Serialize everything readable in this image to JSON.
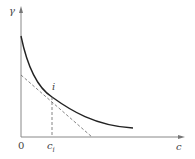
{
  "diagram": {
    "type": "curve-with-tangent",
    "axes": {
      "y_label": "γ",
      "x_label": "c",
      "origin_label": "0"
    },
    "point": {
      "label": "i",
      "x_tick_label": "c",
      "x_tick_subscript": "i"
    },
    "elements": [
      {
        "name": "decreasing-convex-curve",
        "style": "solid"
      },
      {
        "name": "tangent-line-at-i",
        "style": "dashed"
      },
      {
        "name": "drop-line-to-ci",
        "style": "dashed"
      }
    ],
    "colors": {
      "axis": "#888888",
      "curve": "#222222",
      "dashed": "#666666"
    }
  }
}
